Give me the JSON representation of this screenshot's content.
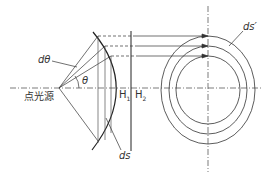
{
  "diagram": {
    "labels": {
      "source": "点光源",
      "dtheta": "dθ",
      "theta": "θ",
      "ds": "ds",
      "ds_prime": "ds′",
      "h1": "H",
      "h1_sub": "1",
      "h2": "H",
      "h2_sub": "2"
    },
    "colors": {
      "line": "#333333",
      "background": "#ffffff"
    }
  }
}
